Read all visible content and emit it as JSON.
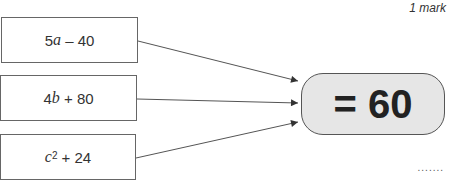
{
  "header": {
    "marks": "1 mark"
  },
  "expressions": [
    {
      "coef": "5",
      "var": "a",
      "sup": "",
      "rest": " – 40"
    },
    {
      "coef": "4",
      "var": "b",
      "sup": "",
      "rest": " + 80"
    },
    {
      "coef": "",
      "var": "c",
      "sup": "2",
      "rest": " + 24"
    }
  ],
  "result": {
    "label": "= 60"
  },
  "answer": {
    "placeholder": "......."
  }
}
